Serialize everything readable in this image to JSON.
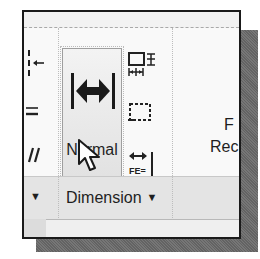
{
  "ribbon": {
    "panel": {
      "title": "Dimension",
      "dropdown_indicator": "▼"
    },
    "left_panel": {
      "dropdown_indicator": "▼",
      "icons": [
        "dimension-break-icon",
        "dimension-space-icon",
        "oblique-icon"
      ]
    },
    "big_button": {
      "label": "Normal",
      "icon": "linear-dimension-icon"
    },
    "small_buttons": [
      {
        "icon": "dimension-space-adjust-icon"
      },
      {
        "icon": "inspect-dimension-icon"
      },
      {
        "icon": "jogged-linear-icon",
        "glyph_text": "FE="
      }
    ],
    "right_partial": {
      "top_text": "F",
      "label_text": "Rec"
    }
  },
  "colors": {
    "frame_border": "#1a1a1a",
    "shadow": "#6e6e6e",
    "ribbon_bg": "#f9f9f9",
    "footer_bg": "#e4e4e4",
    "button_bg": "#e8e8e8",
    "text": "#1f1f1f"
  }
}
